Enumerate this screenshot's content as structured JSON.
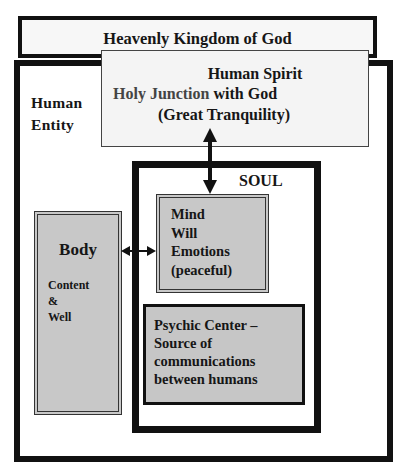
{
  "diagram": {
    "heaven": {
      "title": "Heavenly Kingdom of God"
    },
    "human_entity": {
      "label_line1": "Human",
      "label_line2": "Entity"
    },
    "human_spirit": {
      "title": "Human Spirit",
      "line2_part1": "Holy Junction",
      "line2_part2": " with God",
      "line3": "(Great Tranquility)"
    },
    "soul": {
      "label": "SOUL"
    },
    "mind": {
      "lines": [
        "Mind",
        "Will",
        "Emotions",
        "(peaceful)"
      ]
    },
    "body": {
      "title": "Body",
      "lines": [
        "Content",
        "&",
        "Well"
      ]
    },
    "psychic_center": {
      "lines": [
        "Psychic Center –",
        "Source of",
        "communications",
        "between humans"
      ]
    },
    "connectors": [
      {
        "from": "human_spirit",
        "to": "mind",
        "type": "bidirectional-arrow"
      },
      {
        "from": "body",
        "to": "mind",
        "type": "bidirectional-arrow"
      }
    ],
    "colors": {
      "border": "#111111",
      "fill_gray": "#c8c8c8",
      "fill_light": "#f4f4f4"
    }
  }
}
